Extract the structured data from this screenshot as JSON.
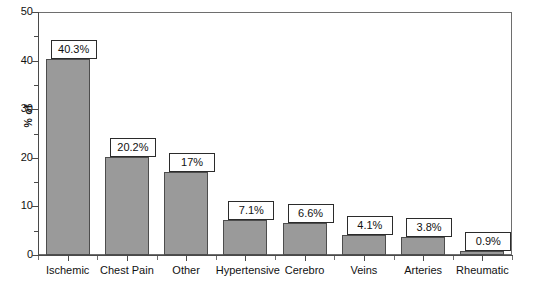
{
  "chart_data": {
    "type": "bar",
    "title": "",
    "subtitle": "",
    "xlabel": "",
    "ylabel": "% of",
    "ylim": [
      0,
      50
    ],
    "y_ticks": [
      0,
      10,
      20,
      30,
      40,
      50
    ],
    "y_tick_labels": [
      "0",
      "10",
      "20",
      "30",
      "40",
      "50"
    ],
    "grid": false,
    "legend": null,
    "categories": [
      "Ischemic",
      "Chest Pain",
      "Other",
      "Hypertensive",
      "Cerebro",
      "Veins",
      "Arteries",
      "Rheumatic"
    ],
    "values": [
      40.3,
      20.2,
      17,
      7.1,
      6.6,
      4.1,
      3.8,
      0.9
    ],
    "data_labels": [
      "40.3%",
      "20.2%",
      "17%",
      "7.1%",
      "6.6%",
      "4.1%",
      "3.8%",
      "0.9%"
    ],
    "bar_color": "#9a9a9a",
    "bar_border_color": "#4d4d4d",
    "axis_color": "#4a4a4a",
    "frame_color": "#6e6e6e",
    "label_box_background": "#ffffff",
    "label_box_border": "#2b2b2b",
    "background": "#ffffff"
  }
}
